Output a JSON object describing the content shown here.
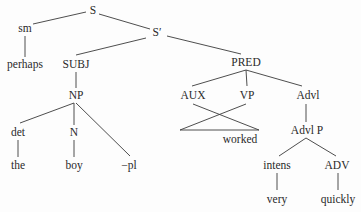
{
  "diagram": {
    "type": "syntax-tree",
    "line_color": "#3a3a3a",
    "text_color": "#2a2a2a",
    "nodes": [
      {
        "id": "S",
        "label": "S",
        "x": 93,
        "y": 11,
        "kind": "category"
      },
      {
        "id": "Sprime",
        "label": "S′",
        "x": 157,
        "y": 33,
        "kind": "category"
      },
      {
        "id": "sm",
        "label": "sm",
        "x": 25,
        "y": 29,
        "kind": "category"
      },
      {
        "id": "perhaps",
        "label": "perhaps",
        "x": 25,
        "y": 65,
        "kind": "word"
      },
      {
        "id": "SUBJ",
        "label": "SUBJ",
        "x": 76,
        "y": 65,
        "kind": "category"
      },
      {
        "id": "NP",
        "label": "NP",
        "x": 76,
        "y": 96,
        "kind": "category"
      },
      {
        "id": "det",
        "label": "det",
        "x": 18,
        "y": 133,
        "kind": "category"
      },
      {
        "id": "N",
        "label": "N",
        "x": 74,
        "y": 133,
        "kind": "category"
      },
      {
        "id": "pl",
        "label": "−pl",
        "x": 129,
        "y": 166,
        "kind": "morpheme"
      },
      {
        "id": "the",
        "label": "the",
        "x": 18,
        "y": 166,
        "kind": "word"
      },
      {
        "id": "boy",
        "label": "boy",
        "x": 74,
        "y": 166,
        "kind": "word"
      },
      {
        "id": "PRED",
        "label": "PRED",
        "x": 246,
        "y": 63,
        "kind": "category"
      },
      {
        "id": "AUX",
        "label": "AUX",
        "x": 193,
        "y": 96,
        "kind": "category"
      },
      {
        "id": "VP",
        "label": "VP",
        "x": 247,
        "y": 96,
        "kind": "category"
      },
      {
        "id": "Advl",
        "label": "Advl",
        "x": 308,
        "y": 96,
        "kind": "category"
      },
      {
        "id": "worked",
        "label": "worked",
        "x": 240,
        "y": 140,
        "kind": "word"
      },
      {
        "id": "AdvlP",
        "label": "Advl P",
        "x": 307,
        "y": 131,
        "kind": "category"
      },
      {
        "id": "intens",
        "label": "intens",
        "x": 277,
        "y": 166,
        "kind": "category"
      },
      {
        "id": "ADV",
        "label": "ADV",
        "x": 337,
        "y": 166,
        "kind": "category"
      },
      {
        "id": "very",
        "label": "very",
        "x": 277,
        "y": 200,
        "kind": "word"
      },
      {
        "id": "quickly",
        "label": "quickly",
        "x": 338,
        "y": 200,
        "kind": "word"
      }
    ],
    "edges": [
      {
        "from": "S",
        "to": "sm",
        "x1": 86,
        "y1": 12,
        "x2": 33,
        "y2": 24
      },
      {
        "from": "S",
        "to": "Sprime",
        "x1": 99,
        "y1": 14,
        "x2": 150,
        "y2": 29
      },
      {
        "from": "sm",
        "to": "perhaps",
        "x1": 25,
        "y1": 36,
        "x2": 25,
        "y2": 57
      },
      {
        "from": "Sprime",
        "to": "SUBJ",
        "x1": 146,
        "y1": 38,
        "x2": 76,
        "y2": 55
      },
      {
        "from": "Sprime",
        "to": "PRED",
        "x1": 167,
        "y1": 36,
        "x2": 241,
        "y2": 54
      },
      {
        "from": "SUBJ",
        "to": "NP",
        "x1": 76,
        "y1": 72,
        "x2": 76,
        "y2": 88
      },
      {
        "from": "NP",
        "to": "det",
        "x1": 74,
        "y1": 103,
        "x2": 20,
        "y2": 123
      },
      {
        "from": "NP",
        "to": "N",
        "x1": 74,
        "y1": 103,
        "x2": 74,
        "y2": 125
      },
      {
        "from": "NP",
        "to": "pl",
        "x1": 76,
        "y1": 103,
        "x2": 130,
        "y2": 156
      },
      {
        "from": "det",
        "to": "the",
        "x1": 18,
        "y1": 140,
        "x2": 18,
        "y2": 157
      },
      {
        "from": "N",
        "to": "boy",
        "x1": 74,
        "y1": 140,
        "x2": 74,
        "y2": 157
      },
      {
        "from": "PRED",
        "to": "AUX",
        "x1": 246,
        "y1": 70,
        "x2": 192,
        "y2": 86
      },
      {
        "from": "PRED",
        "to": "VP",
        "x1": 246,
        "y1": 70,
        "x2": 247,
        "y2": 86
      },
      {
        "from": "PRED",
        "to": "Advl",
        "x1": 246,
        "y1": 70,
        "x2": 302,
        "y2": 86
      },
      {
        "from": "AUX",
        "to": "worked",
        "x1": 193,
        "y1": 104,
        "x2": 259,
        "y2": 130,
        "style": "crossing"
      },
      {
        "from": "VP",
        "to": "worked",
        "x1": 246,
        "y1": 104,
        "x2": 180,
        "y2": 130,
        "style": "crossing"
      },
      {
        "from": "worked",
        "to": "worked",
        "x1": 180,
        "y1": 130,
        "x2": 259,
        "y2": 130,
        "style": "base"
      },
      {
        "from": "Advl",
        "to": "AdvlP",
        "x1": 306,
        "y1": 104,
        "x2": 306,
        "y2": 122
      },
      {
        "from": "AdvlP",
        "to": "intens",
        "x1": 306,
        "y1": 138,
        "x2": 279,
        "y2": 156
      },
      {
        "from": "AdvlP",
        "to": "ADV",
        "x1": 306,
        "y1": 138,
        "x2": 336,
        "y2": 156
      },
      {
        "from": "intens",
        "to": "very",
        "x1": 277,
        "y1": 173,
        "x2": 277,
        "y2": 190
      },
      {
        "from": "ADV",
        "to": "quickly",
        "x1": 338,
        "y1": 173,
        "x2": 338,
        "y2": 190
      }
    ]
  }
}
